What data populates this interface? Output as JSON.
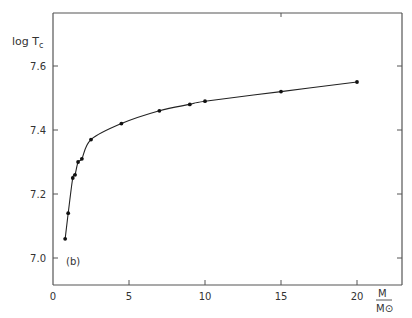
{
  "chart_data": {
    "type": "line",
    "title": "",
    "panel_label": "(b)",
    "xlabel": "M / M_sun",
    "xlabel_numerator": "M",
    "xlabel_denominator": "M⊙",
    "ylabel": "log T_c",
    "ylabel_main": "log  T",
    "ylabel_sub": "c",
    "xlim": [
      0,
      23
    ],
    "ylim": [
      6.92,
      7.76
    ],
    "xticks": [
      0,
      5,
      10,
      15,
      20
    ],
    "xtick_labels": [
      "0",
      "5",
      "10",
      "15",
      "20"
    ],
    "yticks": [
      7.0,
      7.2,
      7.4,
      7.6
    ],
    "ytick_labels": [
      "7.0",
      "7.2",
      "7.4",
      "7.6"
    ],
    "grid": false,
    "legend": null,
    "series": [
      {
        "name": "log Tc vs M",
        "x": [
          0.8,
          1.0,
          1.3,
          1.45,
          1.65,
          1.9,
          2.5,
          4.5,
          7.0,
          9.0,
          10.0,
          15.0,
          20.0
        ],
        "y": [
          7.06,
          7.14,
          7.25,
          7.26,
          7.3,
          7.31,
          7.37,
          7.42,
          7.46,
          7.48,
          7.49,
          7.52,
          7.55
        ],
        "markers": true,
        "smooth_curve": true
      }
    ]
  }
}
